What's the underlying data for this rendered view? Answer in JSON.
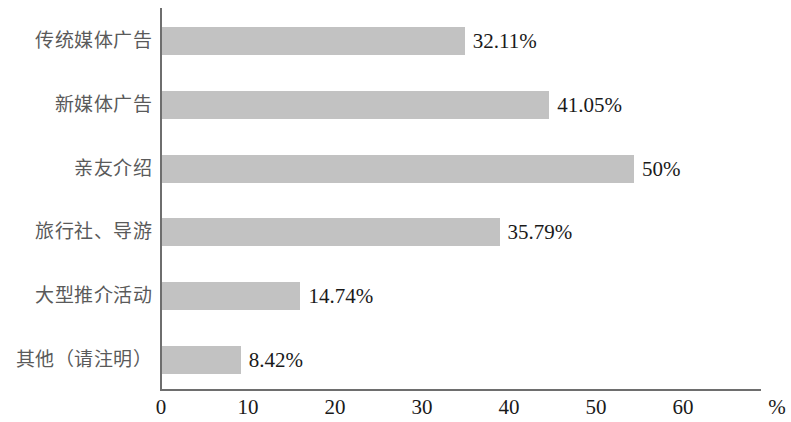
{
  "chart_data": {
    "type": "bar",
    "orientation": "horizontal",
    "title": "",
    "xlabel": "%",
    "ylabel": "",
    "xlim": [
      0,
      60
    ],
    "grid": false,
    "legend": null,
    "bar_color": "#c2c2c2",
    "axis_color": "#6e6e6e",
    "categories": [
      "传统媒体广告",
      "新媒体广告",
      "亲友介绍",
      "旅行社、导游",
      "大型推介活动",
      "其他（请注明）"
    ],
    "values": [
      32.11,
      41.05,
      50,
      35.79,
      14.74,
      8.42
    ],
    "data_labels": [
      "32.11%",
      "41.05%",
      "50%",
      "35.79%",
      "14.74%",
      "8.42%"
    ],
    "xticks": [
      0,
      10,
      20,
      30,
      40,
      50,
      60
    ],
    "xtick_labels": [
      "0",
      "10",
      "20",
      "30",
      "40",
      "50",
      "60"
    ],
    "unit_label": "%"
  }
}
